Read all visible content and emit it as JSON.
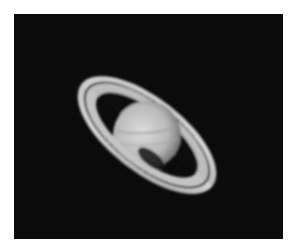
{
  "image": {
    "subject": "Saturn",
    "description": "Grayscale telescope photograph of Saturn with its ring system on a black sky background",
    "colors": {
      "background": "#ffffff",
      "sky": "#0b0b0b",
      "planet_light": "#d9d9d9",
      "planet_shadow": "#8a8a8a",
      "ring_light": "#cfcfcf",
      "ring_gap": "#101010"
    }
  }
}
